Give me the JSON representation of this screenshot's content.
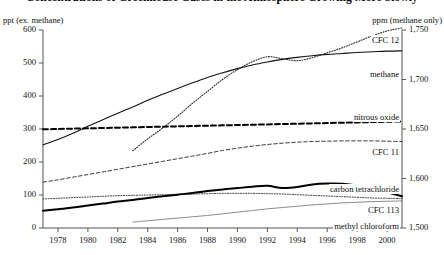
{
  "title": "Concentrations of Greenhouse Gases in the Atmosphere Growing More Slowly",
  "axes": {
    "left_unit": "ppt (ex. methane)",
    "right_unit": "ppm (methane only)",
    "left_ticks": [
      "600",
      "500",
      "400",
      "300",
      "200",
      "100",
      "0"
    ],
    "right_ticks": [
      "1,750",
      "1,700",
      "1,650",
      "1,600",
      "1,500"
    ],
    "x_ticks": [
      "1978",
      "1980",
      "1982",
      "1984",
      "1986",
      "1988",
      "1990",
      "1992",
      "1994",
      "1996",
      "1998",
      "2000"
    ]
  },
  "series_labels": {
    "cfc12": "CFC 12",
    "methane": "methane",
    "nitrous_oxide": "nitrous oxide",
    "cfc11": "CFC 11",
    "carbon_tetrachloride": "carbon tetrachloride",
    "cfc113": "CFC 113",
    "methyl_chloroform": "methyl chloroform"
  },
  "chart_data": {
    "type": "line",
    "title": "Concentrations of Greenhouse Gases in the Atmosphere Growing More Slowly",
    "xlabel": "",
    "ylabel": "ppt (ex. methane)",
    "y2label": "ppm (methane only)",
    "xlim": [
      1977,
      2001
    ],
    "ylim": [
      0,
      600
    ],
    "y2lim": [
      1500,
      1750
    ],
    "y2_tick_values": [
      1500,
      1600,
      1650,
      1700,
      1750
    ],
    "y_tick_values": [
      0,
      100,
      200,
      300,
      400,
      500,
      600
    ],
    "grid": false,
    "legend": "inline-right",
    "x": [
      1977,
      1978,
      1979,
      1980,
      1981,
      1982,
      1983,
      1984,
      1985,
      1986,
      1987,
      1988,
      1989,
      1990,
      1991,
      1992,
      1993,
      1994,
      1995,
      1996,
      1997,
      1998,
      1999,
      2000,
      2001
    ],
    "series": [
      {
        "name": "CFC 12",
        "axis": "left",
        "units": "ppt",
        "style": "solid",
        "width": 1.1,
        "values": [
          252,
          268,
          287,
          308,
          328,
          348,
          367,
          387,
          405,
          423,
          440,
          456,
          470,
          483,
          494,
          503,
          511,
          517,
          522,
          526,
          529,
          532,
          534,
          536,
          537
        ]
      },
      {
        "name": "methane",
        "axis": "right",
        "units": "ppb",
        "style": "dotted",
        "width": 1.1,
        "start_year": 1983,
        "values": [
          null,
          null,
          null,
          null,
          null,
          null,
          1628,
          1640,
          1651,
          1663,
          1676,
          1688,
          1700,
          1710,
          1718,
          1723,
          1721,
          1719,
          1722,
          1727,
          1732,
          1738,
          1744,
          1749,
          1752
        ]
      },
      {
        "name": "nitrous oxide",
        "axis": "left",
        "units": "ppt",
        "style": "dashed-thick",
        "width": 2.0,
        "values": [
          299,
          300,
          301,
          302,
          303,
          304,
          305,
          306,
          307,
          308,
          309,
          310,
          311,
          312,
          313,
          314,
          315,
          316,
          317,
          318,
          319,
          320,
          321,
          322,
          323
        ]
      },
      {
        "name": "CFC 11",
        "axis": "left",
        "units": "ppt",
        "style": "dashed-thin",
        "width": 1.0,
        "values": [
          139,
          146,
          154,
          162,
          170,
          178,
          186,
          194,
          202,
          210,
          218,
          226,
          235,
          242,
          248,
          253,
          257,
          260,
          262,
          263,
          264,
          264,
          264,
          263,
          262
        ]
      },
      {
        "name": "carbon tetrachloride",
        "axis": "left",
        "units": "ppt",
        "style": "dotted",
        "width": 1.0,
        "values": [
          88,
          90,
          92,
          94,
          96,
          98,
          99,
          100,
          101,
          102,
          103,
          104,
          105,
          105,
          105,
          104,
          103,
          101,
          99,
          97,
          95,
          93,
          91,
          90,
          89
        ]
      },
      {
        "name": "CFC 113",
        "axis": "left",
        "units": "ppt",
        "style": "solid-thin",
        "width": 0.8,
        "start_year": 1983,
        "values": [
          null,
          null,
          null,
          null,
          null,
          null,
          18,
          22,
          26,
          30,
          34,
          38,
          43,
          48,
          53,
          58,
          62,
          66,
          70,
          73,
          76,
          78,
          80,
          81,
          82
        ]
      },
      {
        "name": "methyl chloroform",
        "axis": "left",
        "units": "ppt",
        "style": "solid-thick",
        "width": 2.0,
        "values": [
          52,
          57,
          62,
          68,
          74,
          80,
          85,
          91,
          96,
          101,
          106,
          112,
          117,
          121,
          125,
          128,
          121,
          124,
          132,
          135,
          134,
          129,
          120,
          108,
          96
        ]
      }
    ]
  }
}
